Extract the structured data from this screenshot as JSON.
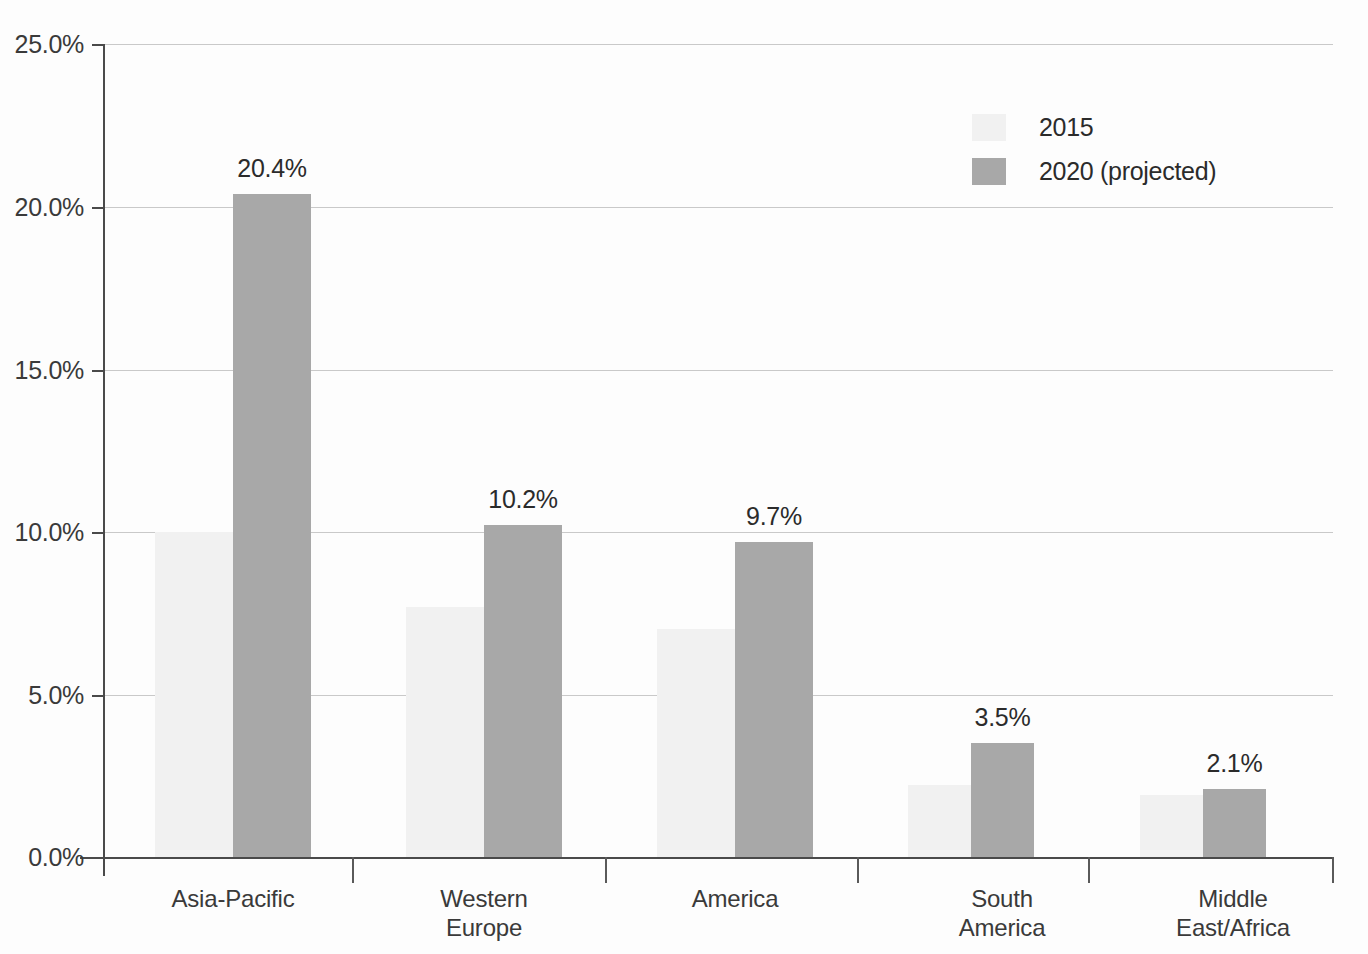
{
  "chart_data": {
    "type": "bar",
    "title": "",
    "subtitle": "",
    "xlabel": "",
    "ylabel": "",
    "ylim": [
      0,
      25
    ],
    "ytick_labels": [
      "0.0%",
      "5.0%",
      "10.0%",
      "15.0%",
      "20.0%",
      "25.0%"
    ],
    "ytick_values": [
      0,
      5,
      10,
      15,
      20,
      25
    ],
    "grid": true,
    "legend_position": "top-right",
    "categories": [
      "Asia-Pacific",
      "Western Europe",
      "America",
      "South America",
      "Middle East/Africa"
    ],
    "category_label_lines": [
      [
        "Asia-Pacific"
      ],
      [
        "Western",
        "Europe"
      ],
      [
        "America"
      ],
      [
        "South",
        "America"
      ],
      [
        "Middle",
        "East/Africa"
      ]
    ],
    "series": [
      {
        "name": "2015",
        "color": "#f1f1f1",
        "values": [
          10.0,
          7.7,
          7.0,
          2.2,
          1.9
        ],
        "labels": [
          "",
          "",
          "",
          "",
          ""
        ]
      },
      {
        "name": "2020 (projected)",
        "color": "#a8a8a8",
        "values": [
          20.4,
          10.2,
          9.7,
          3.5,
          2.1
        ],
        "labels": [
          "20.4%",
          "10.2%",
          "9.7%",
          "3.5%",
          "2.1%"
        ]
      }
    ]
  },
  "legend": {
    "items": [
      {
        "label": "2015",
        "swatch": "#f1f1f1"
      },
      {
        "label": "2020 (projected)",
        "swatch": "#a8a8a8"
      }
    ]
  },
  "axis": {
    "y_labels": [
      "25.0%",
      "20.0%",
      "15.0%",
      "10.0%",
      "5.0%",
      "0.0%"
    ]
  },
  "colors": {
    "series_2015": "#f1f1f1",
    "series_2020": "#a8a8a8",
    "gridline": "#c9c9c9",
    "axis": "#4a4a4a",
    "text": "#2e2e2e",
    "background": "#fdfdfd"
  }
}
